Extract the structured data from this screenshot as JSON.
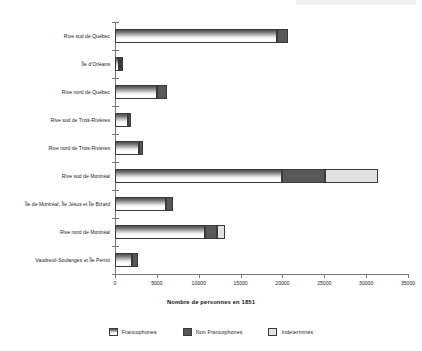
{
  "chart_data": {
    "type": "bar",
    "orientation": "horizontal",
    "stacked": true,
    "title": "",
    "xlabel": "Nombre de personnes en 1851",
    "ylabel": "",
    "xlim": [
      0,
      35000
    ],
    "xticks": [
      "0",
      "5000",
      "10000",
      "15000",
      "20000",
      "25000",
      "30000",
      "35000"
    ],
    "xtick_values": [
      0,
      5000,
      10000,
      15000,
      20000,
      25000,
      30000,
      35000
    ],
    "grid": false,
    "legend_position": "bottom",
    "categories": [
      "Rive sud de Québec",
      "Île d'Orléans",
      "Rive nord de Québec",
      "Rive sud de Trois-Rivières",
      "Rive nord de Trois-Rivières",
      "Rive sud de Montréal",
      "Île de Montréal, Île Jésus et Île Bizard",
      "Rive nord de Montréal",
      "Vaudreuil-Soulanges et Île Perrot"
    ],
    "series": [
      {
        "name": "Francophones",
        "color": "#b8b8b8",
        "values": [
          19400,
          500,
          5000,
          1550,
          2900,
          20000,
          6100,
          10750,
          2050
        ]
      },
      {
        "name": "Non Francophones",
        "color": "#585858",
        "values": [
          1300,
          100,
          1200,
          350,
          450,
          5100,
          850,
          1450,
          700
        ]
      },
      {
        "name": "Indéterminés",
        "color": "#e2e2e2",
        "values": [
          0,
          100,
          0,
          0,
          0,
          6300,
          0,
          950,
          0
        ]
      }
    ],
    "totals": [
      20700,
      700,
      6200,
      1900,
      3350,
      31400,
      6950,
      13150,
      2750
    ]
  },
  "legend": {
    "items": [
      {
        "label": "Francophones",
        "swatch": "francophones-swatch"
      },
      {
        "label": "Non Francophones",
        "swatch": "non-francophones-swatch"
      },
      {
        "label": "Indéterminés",
        "swatch": "indetermines-swatch"
      }
    ]
  },
  "colors": {
    "francophones": "#b8b8b8",
    "non_francophones": "#585858",
    "indetermines": "#e2e2e2",
    "axis": "#7a7a7a",
    "text": "#1a1a1a"
  }
}
